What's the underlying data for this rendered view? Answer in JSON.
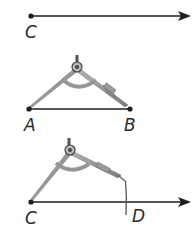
{
  "colors": {
    "line": "#1e1e1e",
    "compass_leg": "#8c8c8c",
    "compass_dark": "#555555",
    "arc": "#9a9a9a",
    "label": "#2a2a2a"
  },
  "steps": [
    {
      "name": "step-1-draw-ray",
      "points": [
        {
          "label": "C"
        }
      ],
      "description": "Ray starting at point C"
    },
    {
      "name": "step-2-measure-AB",
      "points": [
        {
          "label": "A"
        },
        {
          "label": "B"
        }
      ],
      "description": "Compass opened to length of segment AB"
    },
    {
      "name": "step-3-mark-D",
      "points": [
        {
          "label": "C"
        },
        {
          "label": "D"
        }
      ],
      "description": "Compass placed at C, arc drawn crossing ray at D"
    }
  ]
}
